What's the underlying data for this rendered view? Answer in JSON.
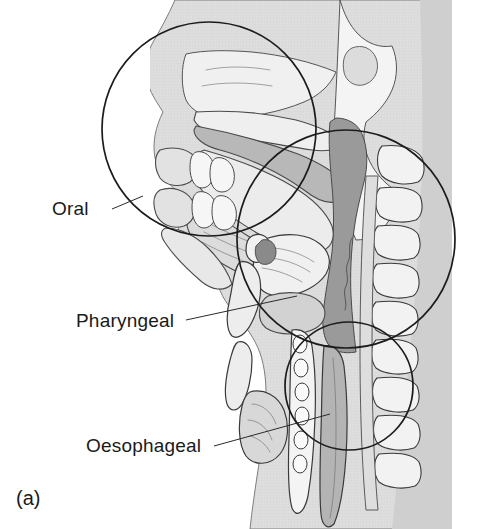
{
  "figure": {
    "caption": "(a)",
    "title_visible": false
  },
  "labels": [
    {
      "id": "oral",
      "text": "Oral",
      "x": 52,
      "y": 215,
      "anchor": "start"
    },
    {
      "id": "pharyngeal",
      "text": "Pharyngeal",
      "x": 76,
      "y": 327,
      "anchor": "start"
    },
    {
      "id": "oesophageal",
      "text": "Oesophageal",
      "x": 86,
      "y": 452,
      "anchor": "start"
    }
  ],
  "leaders": [
    {
      "id": "leader-oral",
      "x1": 112,
      "y1": 209,
      "x2": 143,
      "y2": 196
    },
    {
      "id": "leader-pharyngeal",
      "x1": 186,
      "y1": 320,
      "x2": 297,
      "y2": 296
    },
    {
      "id": "leader-oesophageal",
      "x1": 214,
      "y1": 446,
      "x2": 330,
      "y2": 414
    }
  ],
  "phase_circles": [
    {
      "id": "circle-oral",
      "label": "Oral",
      "cx": 209,
      "cy": 129,
      "r": 107
    },
    {
      "id": "circle-pharyngeal",
      "label": "Pharyngeal",
      "cx": 346,
      "cy": 239,
      "r": 109
    },
    {
      "id": "circle-oesophageal",
      "label": "Oesophageal",
      "cx": 349,
      "cy": 386,
      "r": 64
    }
  ],
  "anatomy_parts": [
    "skin-and-soft-tissue-profile",
    "nasal-cavity",
    "hard-palate",
    "soft-palate",
    "oral-cavity",
    "tongue",
    "upper-lip",
    "lower-lip",
    "upper-teeth",
    "lower-teeth",
    "mandible",
    "nasopharynx",
    "oropharynx",
    "epiglottis",
    "hyoid-bone",
    "thyroid-cartilage",
    "cricoid-cartilage",
    "larynx",
    "trachea",
    "tracheal-rings",
    "oesophagus",
    "thyroid-gland",
    "cervical-vertebrae",
    "spinal-canal",
    "skull-base"
  ],
  "colors": {
    "background": "#ffffff",
    "skin_tone": "#d9d9d9",
    "soft_tissue_light": "#e6e6e6",
    "muscle_mid": "#c3c3c3",
    "pharynx_dark": "#9a9a9a",
    "airway_dark": "#8e8e8e",
    "bone_light": "#f1f1f1",
    "cartilage": "#ececec",
    "outline": "#3a3a3a",
    "circle_stroke": "#1c1c1c",
    "text": "#1a1a1a"
  }
}
